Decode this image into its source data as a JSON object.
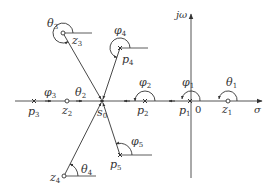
{
  "colors": {
    "line": "#333333",
    "axis": "#555555",
    "background": "#ffffff"
  },
  "axes": {
    "real_label": "σ",
    "imag_label": "jω",
    "origin_label": "0"
  },
  "test_point": {
    "name": "s",
    "sub": "0"
  },
  "poles": [
    {
      "name": "p",
      "sub": "1",
      "angle_name": "φ",
      "angle_sub": "1"
    },
    {
      "name": "p",
      "sub": "2",
      "angle_name": "φ",
      "angle_sub": "2"
    },
    {
      "name": "p",
      "sub": "3",
      "angle_name": "φ",
      "angle_sub": "3"
    },
    {
      "name": "p",
      "sub": "4",
      "angle_name": "φ",
      "angle_sub": "4"
    },
    {
      "name": "p",
      "sub": "5",
      "angle_name": "φ",
      "angle_sub": "5"
    }
  ],
  "zeros": [
    {
      "name": "z",
      "sub": "1",
      "angle_name": "θ",
      "angle_sub": "1"
    },
    {
      "name": "z",
      "sub": "2",
      "angle_name": "θ",
      "angle_sub": "2"
    },
    {
      "name": "z",
      "sub": "3",
      "angle_name": "θ",
      "angle_sub": "3"
    },
    {
      "name": "z",
      "sub": "4",
      "angle_name": "θ",
      "angle_sub": "4"
    }
  ]
}
